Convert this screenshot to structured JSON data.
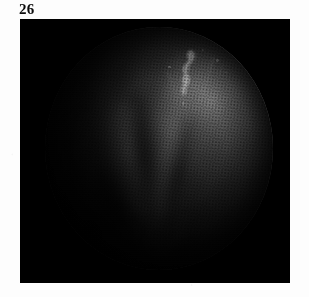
{
  "page": {
    "figure_number": "26",
    "background_color": "#ffffff"
  },
  "figure": {
    "frame": {
      "background_color": "#000000",
      "x": 20,
      "y": 19,
      "width": 270,
      "height": 264
    },
    "field_of_view": {
      "shape": "circle",
      "center_x": 159,
      "center_y": 148,
      "radius_x": 114,
      "radius_y": 121
    },
    "image_type": "halftone-printed endoscopic photograph",
    "tone": {
      "darkest": "#000000",
      "midtone": "#4a4a4a",
      "bright_tissue": "#9a9a9a",
      "specular_highlight": "#ffffff"
    },
    "features": {
      "specular_highlight_label": "specular light reflection",
      "fold_label": "mucosal fold",
      "groove_label": "crease shadow",
      "filament_label": "fine filament streak"
    }
  }
}
